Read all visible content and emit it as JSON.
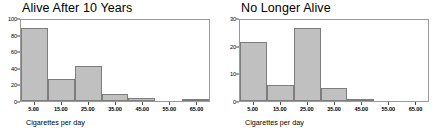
{
  "chart_data": [
    {
      "type": "bar",
      "title": "Alive After 10 Years",
      "xlabel": "Cigarettes per day",
      "ylabel": "",
      "categories": [
        "5.00",
        "15.00",
        "25.00",
        "35.00",
        "45.00",
        "55.00",
        "65.00"
      ],
      "values": [
        90,
        27,
        43,
        9,
        4,
        0,
        1
      ],
      "xticks": [
        "5.00",
        "15.00",
        "25.00",
        "35.00",
        "45.00",
        "55.00",
        "65.00"
      ],
      "yticks": [
        "0",
        "20",
        "40",
        "60",
        "80",
        "100"
      ],
      "ylim": [
        0,
        100
      ],
      "grid": false,
      "legend": "none",
      "bar_fill": "#c0c0c0",
      "bar_border": "#7d7d7d"
    },
    {
      "type": "bar",
      "title": "No Longer Alive",
      "xlabel": "Cigarettes per day",
      "ylabel": "",
      "categories": [
        "5.00",
        "15.00",
        "25.00",
        "35.00",
        "45.00",
        "55.00",
        "65.00"
      ],
      "values": [
        22,
        6,
        27,
        5,
        0.4,
        0,
        0
      ],
      "xticks": [
        "5.00",
        "15.00",
        "25.00",
        "35.00",
        "45.00",
        "55.00",
        "65.00"
      ],
      "yticks": [
        "0",
        "10",
        "20",
        "30"
      ],
      "ylim": [
        0,
        30
      ],
      "grid": false,
      "legend": "none",
      "bar_fill": "#c0c0c0",
      "bar_border": "#7d7d7d"
    }
  ]
}
